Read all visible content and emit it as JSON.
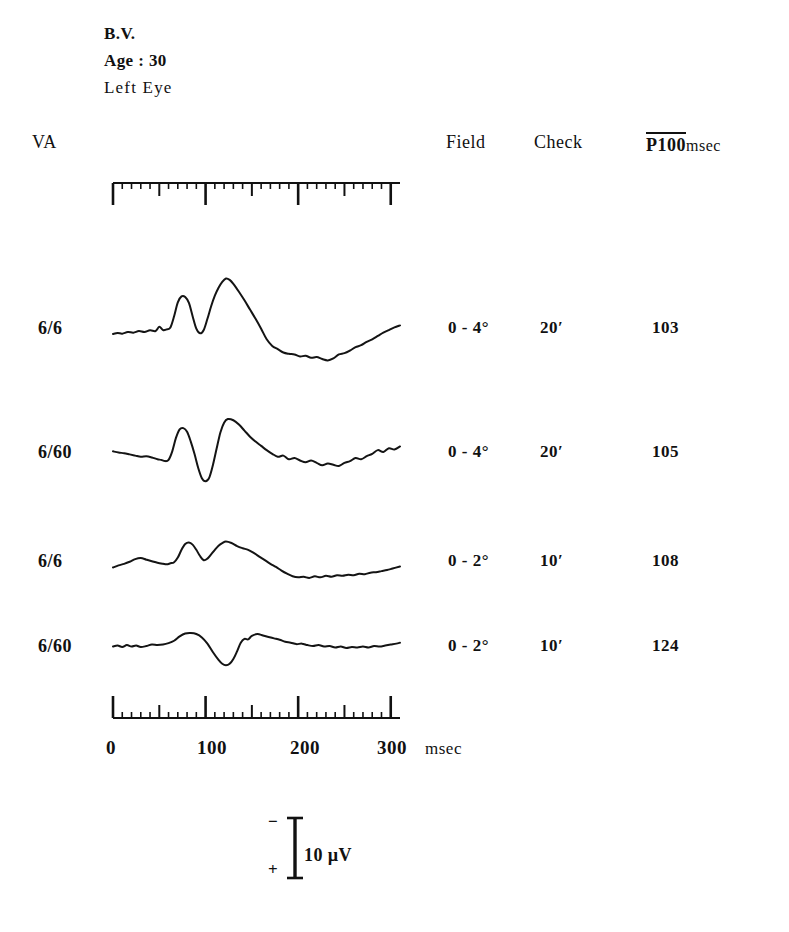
{
  "patient": {
    "name": "B.V.",
    "age_line": "Age : 30",
    "eye": "Left Eye"
  },
  "headers": {
    "va": "VA",
    "field": "Field",
    "check": "Check",
    "p100": "P100",
    "p100_unit": "msec"
  },
  "rows": [
    {
      "va": "6/6",
      "field": "0 - 4°",
      "check": "20′",
      "p100": "103"
    },
    {
      "va": "6/60",
      "field": "0 - 4°",
      "check": "20′",
      "p100": "105"
    },
    {
      "va": "6/6",
      "field": "0 - 2°",
      "check": "10′",
      "p100": "108"
    },
    {
      "va": "6/60",
      "field": "0 - 2°",
      "check": "10′",
      "p100": "124"
    }
  ],
  "time_axis": {
    "ticks": [
      "0",
      "100",
      "200",
      "300"
    ],
    "unit": "msec",
    "range_ms": [
      0,
      310
    ],
    "minor_tick_ms": 10,
    "medium_tick_ms": 50,
    "major_tick_ms": 100
  },
  "calibration": {
    "negative_sign": "−",
    "positive_sign": "+",
    "label": "10 µV"
  },
  "chart_data": {
    "type": "line",
    "xlabel": "msec",
    "ylabel": "Amplitude (µV)",
    "xlim": [
      0,
      310
    ],
    "grid": false,
    "legend": "none",
    "calibration_uv": 10,
    "polarity": "negative up",
    "series": [
      {
        "name": "6/6, 0-4°, 20′",
        "p100_ms": 103,
        "points": [
          [
            0,
            0
          ],
          [
            5,
            0.3
          ],
          [
            10,
            0.1
          ],
          [
            16,
            0.6
          ],
          [
            22,
            0.4
          ],
          [
            28,
            0.9
          ],
          [
            34,
            0.6
          ],
          [
            40,
            1.1
          ],
          [
            46,
            0.9
          ],
          [
            50,
            2.2
          ],
          [
            54,
            1.2
          ],
          [
            58,
            1.4
          ],
          [
            62,
            2.0
          ],
          [
            66,
            5.4
          ],
          [
            70,
            9.6
          ],
          [
            74,
            11.4
          ],
          [
            78,
            11.2
          ],
          [
            82,
            9.4
          ],
          [
            86,
            5.4
          ],
          [
            90,
            1.6
          ],
          [
            94,
            0.2
          ],
          [
            98,
            1.2
          ],
          [
            102,
            4.6
          ],
          [
            106,
            8.4
          ],
          [
            110,
            11.6
          ],
          [
            114,
            14.0
          ],
          [
            118,
            15.8
          ],
          [
            122,
            16.8
          ],
          [
            126,
            16.4
          ],
          [
            130,
            15.2
          ],
          [
            136,
            12.8
          ],
          [
            142,
            10.2
          ],
          [
            148,
            7.4
          ],
          [
            154,
            4.6
          ],
          [
            160,
            1.6
          ],
          [
            166,
            -1.6
          ],
          [
            172,
            -3.6
          ],
          [
            178,
            -4.6
          ],
          [
            184,
            -5.6
          ],
          [
            190,
            -6.0
          ],
          [
            196,
            -6.2
          ],
          [
            202,
            -6.8
          ],
          [
            208,
            -6.6
          ],
          [
            214,
            -7.2
          ],
          [
            220,
            -7.0
          ],
          [
            226,
            -7.6
          ],
          [
            232,
            -8.0
          ],
          [
            238,
            -7.4
          ],
          [
            244,
            -6.2
          ],
          [
            250,
            -5.8
          ],
          [
            256,
            -5.0
          ],
          [
            262,
            -4.0
          ],
          [
            268,
            -3.4
          ],
          [
            274,
            -2.4
          ],
          [
            280,
            -1.6
          ],
          [
            286,
            -0.6
          ],
          [
            292,
            0.4
          ],
          [
            298,
            1.2
          ],
          [
            304,
            2.0
          ],
          [
            310,
            2.6
          ]
        ]
      },
      {
        "name": "6/60, 0-4°, 20′",
        "p100_ms": 105,
        "points": [
          [
            0,
            1.2
          ],
          [
            6,
            0.8
          ],
          [
            12,
            0.6
          ],
          [
            18,
            0.2
          ],
          [
            24,
            -0.2
          ],
          [
            30,
            -0.6
          ],
          [
            36,
            -0.4
          ],
          [
            42,
            -0.8
          ],
          [
            48,
            -1.4
          ],
          [
            52,
            -1.6
          ],
          [
            56,
            -2.0
          ],
          [
            60,
            -1.6
          ],
          [
            64,
            1.2
          ],
          [
            68,
            5.6
          ],
          [
            72,
            8.4
          ],
          [
            76,
            8.8
          ],
          [
            80,
            7.6
          ],
          [
            84,
            4.4
          ],
          [
            88,
            0.4
          ],
          [
            92,
            -4.2
          ],
          [
            96,
            -7.6
          ],
          [
            100,
            -8.6
          ],
          [
            104,
            -7.4
          ],
          [
            108,
            -3.2
          ],
          [
            112,
            2.2
          ],
          [
            116,
            7.4
          ],
          [
            120,
            10.6
          ],
          [
            124,
            11.8
          ],
          [
            130,
            11.4
          ],
          [
            136,
            10.0
          ],
          [
            142,
            8.0
          ],
          [
            148,
            6.0
          ],
          [
            154,
            4.4
          ],
          [
            160,
            3.0
          ],
          [
            166,
            1.6
          ],
          [
            172,
            0.4
          ],
          [
            178,
            -0.6
          ],
          [
            184,
            -0.2
          ],
          [
            190,
            -1.4
          ],
          [
            196,
            -1.0
          ],
          [
            202,
            -1.8
          ],
          [
            208,
            -2.4
          ],
          [
            214,
            -1.8
          ],
          [
            220,
            -2.6
          ],
          [
            226,
            -3.4
          ],
          [
            232,
            -2.8
          ],
          [
            238,
            -3.2
          ],
          [
            244,
            -3.6
          ],
          [
            250,
            -2.6
          ],
          [
            256,
            -2.0
          ],
          [
            262,
            -1.0
          ],
          [
            268,
            -1.4
          ],
          [
            274,
            -0.4
          ],
          [
            280,
            0.4
          ],
          [
            286,
            1.6
          ],
          [
            292,
            1.0
          ],
          [
            298,
            2.2
          ],
          [
            304,
            1.8
          ],
          [
            310,
            2.8
          ]
        ]
      },
      {
        "name": "6/6, 0-2°, 10′",
        "p100_ms": 108,
        "points": [
          [
            0,
            0.2
          ],
          [
            6,
            1.0
          ],
          [
            12,
            1.6
          ],
          [
            18,
            2.4
          ],
          [
            24,
            3.4
          ],
          [
            30,
            3.8
          ],
          [
            36,
            3.2
          ],
          [
            42,
            2.6
          ],
          [
            48,
            2.0
          ],
          [
            54,
            1.6
          ],
          [
            58,
            1.4
          ],
          [
            62,
            1.8
          ],
          [
            66,
            2.2
          ],
          [
            70,
            4.0
          ],
          [
            74,
            7.0
          ],
          [
            78,
            9.2
          ],
          [
            82,
            9.8
          ],
          [
            86,
            9.0
          ],
          [
            90,
            7.0
          ],
          [
            94,
            4.6
          ],
          [
            98,
            3.0
          ],
          [
            102,
            3.6
          ],
          [
            106,
            5.2
          ],
          [
            110,
            7.0
          ],
          [
            114,
            8.6
          ],
          [
            118,
            9.6
          ],
          [
            122,
            10.2
          ],
          [
            128,
            9.6
          ],
          [
            134,
            8.4
          ],
          [
            140,
            7.6
          ],
          [
            146,
            7.0
          ],
          [
            152,
            5.8
          ],
          [
            158,
            4.4
          ],
          [
            164,
            3.0
          ],
          [
            170,
            1.6
          ],
          [
            176,
            0.4
          ],
          [
            182,
            -1.0
          ],
          [
            188,
            -2.2
          ],
          [
            194,
            -3.2
          ],
          [
            200,
            -3.6
          ],
          [
            206,
            -3.4
          ],
          [
            212,
            -3.8
          ],
          [
            218,
            -3.2
          ],
          [
            224,
            -3.6
          ],
          [
            230,
            -3.0
          ],
          [
            236,
            -3.4
          ],
          [
            242,
            -2.8
          ],
          [
            248,
            -3.0
          ],
          [
            254,
            -2.6
          ],
          [
            260,
            -2.8
          ],
          [
            266,
            -2.2
          ],
          [
            272,
            -2.4
          ],
          [
            278,
            -1.8
          ],
          [
            284,
            -1.6
          ],
          [
            290,
            -1.2
          ],
          [
            296,
            -0.8
          ],
          [
            302,
            -0.2
          ],
          [
            310,
            0.6
          ]
        ]
      },
      {
        "name": "6/60, 0-2°, 10′",
        "p100_ms": 124,
        "points": [
          [
            0,
            0.2
          ],
          [
            5,
            0.6
          ],
          [
            10,
            0.0
          ],
          [
            15,
            0.8
          ],
          [
            20,
            0.2
          ],
          [
            25,
            0.6
          ],
          [
            30,
            0.0
          ],
          [
            36,
            0.4
          ],
          [
            42,
            1.0
          ],
          [
            48,
            0.8
          ],
          [
            54,
            1.0
          ],
          [
            60,
            1.6
          ],
          [
            66,
            2.6
          ],
          [
            72,
            4.4
          ],
          [
            78,
            5.6
          ],
          [
            84,
            5.8
          ],
          [
            90,
            5.4
          ],
          [
            96,
            4.0
          ],
          [
            102,
            1.4
          ],
          [
            108,
            -2.2
          ],
          [
            114,
            -5.4
          ],
          [
            118,
            -7.0
          ],
          [
            122,
            -7.6
          ],
          [
            126,
            -7.0
          ],
          [
            130,
            -5.0
          ],
          [
            134,
            -1.8
          ],
          [
            138,
            1.8
          ],
          [
            142,
            3.4
          ],
          [
            146,
            3.2
          ],
          [
            150,
            4.6
          ],
          [
            156,
            5.4
          ],
          [
            162,
            4.8
          ],
          [
            168,
            4.2
          ],
          [
            174,
            3.6
          ],
          [
            180,
            3.0
          ],
          [
            186,
            2.2
          ],
          [
            192,
            1.8
          ],
          [
            198,
            1.2
          ],
          [
            204,
            1.4
          ],
          [
            210,
            0.8
          ],
          [
            216,
            0.4
          ],
          [
            222,
            0.8
          ],
          [
            228,
            0.2
          ],
          [
            234,
            0.4
          ],
          [
            240,
            -0.2
          ],
          [
            246,
            0.2
          ],
          [
            252,
            -0.4
          ],
          [
            258,
            0.0
          ],
          [
            264,
            -0.2
          ],
          [
            270,
            0.2
          ],
          [
            276,
            -0.2
          ],
          [
            282,
            0.4
          ],
          [
            288,
            0.2
          ],
          [
            294,
            0.6
          ],
          [
            300,
            1.0
          ],
          [
            306,
            1.4
          ],
          [
            310,
            1.8
          ]
        ]
      }
    ]
  }
}
